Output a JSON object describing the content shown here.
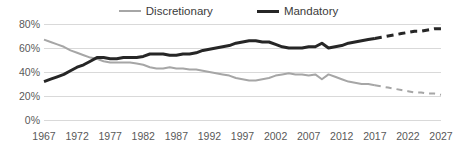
{
  "chart_data": {
    "type": "line",
    "title": "",
    "xlabel": "",
    "ylabel": "",
    "ylim": [
      0,
      80
    ],
    "xlim": [
      1967,
      2027
    ],
    "grid": true,
    "legend_position": "top-center",
    "y_ticks": [
      "0%",
      "20%",
      "40%",
      "60%",
      "80%"
    ],
    "y_tick_values": [
      0,
      20,
      40,
      60,
      80
    ],
    "x_ticks": [
      "1967",
      "1972",
      "1977",
      "1982",
      "1987",
      "1992",
      "1997",
      "2002",
      "2007",
      "2012",
      "2017",
      "2022",
      "2027"
    ],
    "x_tick_values": [
      1967,
      1972,
      1977,
      1982,
      1987,
      1992,
      1997,
      2002,
      2007,
      2012,
      2017,
      2022,
      2027
    ],
    "forecast_start_year": 2017,
    "series": [
      {
        "name": "Discretionary",
        "color": "#a6a6a6",
        "line_width": 2,
        "x": [
          1967,
          1968,
          1969,
          1970,
          1971,
          1972,
          1973,
          1974,
          1975,
          1976,
          1977,
          1978,
          1979,
          1980,
          1981,
          1982,
          1983,
          1984,
          1985,
          1986,
          1987,
          1988,
          1989,
          1990,
          1991,
          1992,
          1993,
          1994,
          1995,
          1996,
          1997,
          1998,
          1999,
          2000,
          2001,
          2002,
          2003,
          2004,
          2005,
          2006,
          2007,
          2008,
          2009,
          2010,
          2011,
          2012,
          2013,
          2014,
          2015,
          2016,
          2017
        ],
        "values": [
          67,
          65,
          63,
          61,
          58,
          56,
          54,
          52,
          51,
          49,
          48,
          48,
          48,
          48,
          47,
          46,
          44,
          43,
          43,
          44,
          43,
          43,
          42,
          42,
          41,
          40,
          39,
          38,
          37,
          35,
          34,
          33,
          33,
          34,
          35,
          37,
          38,
          39,
          38,
          38,
          37,
          38,
          34,
          38,
          36,
          34,
          32,
          31,
          30,
          30,
          29
        ]
      },
      {
        "name": "Discretionary (projected)",
        "color": "#a6a6a6",
        "line_width": 2,
        "dashed": true,
        "x": [
          2017,
          2018,
          2019,
          2020,
          2021,
          2022,
          2023,
          2024,
          2025,
          2026,
          2027
        ],
        "values": [
          29,
          28,
          27,
          26,
          25,
          24,
          23,
          23,
          22,
          22,
          21
        ]
      },
      {
        "name": "Mandatory",
        "color": "#262626",
        "line_width": 3,
        "x": [
          1967,
          1968,
          1969,
          1970,
          1971,
          1972,
          1973,
          1974,
          1975,
          1976,
          1977,
          1978,
          1979,
          1980,
          1981,
          1982,
          1983,
          1984,
          1985,
          1986,
          1987,
          1988,
          1989,
          1990,
          1991,
          1992,
          1993,
          1994,
          1995,
          1996,
          1997,
          1998,
          1999,
          2000,
          2001,
          2002,
          2003,
          2004,
          2005,
          2006,
          2007,
          2008,
          2009,
          2010,
          2011,
          2012,
          2013,
          2014,
          2015,
          2016,
          2017
        ],
        "values": [
          32,
          34,
          36,
          38,
          41,
          44,
          46,
          49,
          52,
          52,
          51,
          51,
          52,
          52,
          52,
          53,
          55,
          55,
          55,
          54,
          54,
          55,
          55,
          56,
          58,
          59,
          60,
          61,
          62,
          64,
          65,
          66,
          66,
          65,
          65,
          63,
          61,
          60,
          60,
          60,
          61,
          61,
          64,
          60,
          61,
          62,
          64,
          65,
          66,
          67,
          68
        ]
      },
      {
        "name": "Mandatory (projected)",
        "color": "#262626",
        "line_width": 3,
        "dashed": true,
        "x": [
          2017,
          2018,
          2019,
          2020,
          2021,
          2022,
          2023,
          2024,
          2025,
          2026,
          2027
        ],
        "values": [
          68,
          69,
          70,
          71,
          72,
          73,
          74,
          74,
          75,
          76,
          76
        ]
      }
    ],
    "legend": [
      {
        "label": "Discretionary",
        "color": "#a6a6a6"
      },
      {
        "label": "Mandatory",
        "color": "#262626"
      }
    ]
  },
  "legend": {
    "discretionary_label": "Discretionary",
    "mandatory_label": "Mandatory"
  },
  "colors": {
    "discretionary": "#a6a6a6",
    "mandatory": "#262626",
    "grid": "#d9d9d9",
    "tick_text": "#595959"
  }
}
